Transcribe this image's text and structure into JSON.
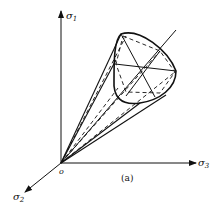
{
  "figure": {
    "caption": "(a)",
    "origin_label": "o",
    "axes": {
      "sigma1": {
        "label": "σ",
        "subscript": "1"
      },
      "sigma2": {
        "label": "σ",
        "subscript": "2"
      },
      "sigma3": {
        "label": "σ",
        "subscript": "3"
      }
    },
    "colors": {
      "ink": "#111111",
      "background": "#ffffff"
    }
  }
}
